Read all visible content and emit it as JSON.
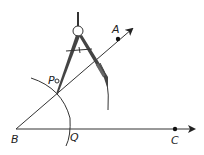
{
  "diagram": {
    "labels": {
      "A": "A",
      "B": "B",
      "C": "C",
      "P": "P",
      "Q": "Q"
    },
    "points": {
      "B": [
        16,
        129
      ],
      "A": [
        118,
        39
      ],
      "C": [
        175,
        129
      ],
      "P": [
        56,
        95
      ],
      "Q": [
        68,
        129
      ]
    },
    "rays": [
      {
        "name": "BA",
        "from": "B",
        "through": "A"
      },
      {
        "name": "BC",
        "from": "B",
        "through": "C"
      }
    ],
    "arcs": [
      {
        "name": "arc-PQ",
        "center": "B"
      },
      {
        "name": "arc-from-P",
        "center": "P"
      }
    ],
    "tools": [
      "compass"
    ],
    "colors": {
      "line": "#333333",
      "compass": "#444444",
      "background": "#ffffff"
    }
  }
}
